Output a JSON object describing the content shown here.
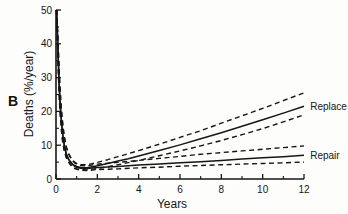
{
  "figure": {
    "panel_label": "B"
  },
  "chart_data": {
    "type": "line",
    "title": "",
    "xlabel": "Years",
    "ylabel": "Deaths (%/year)",
    "xlim": [
      0,
      12
    ],
    "ylim": [
      0,
      50
    ],
    "grid": false,
    "legend_position": "right-annotations",
    "line_color": "#161616",
    "x_ticks": [
      0,
      2,
      4,
      6,
      8,
      10,
      12
    ],
    "x_minor_ticks": [
      1,
      3,
      5,
      7,
      9,
      11
    ],
    "y_ticks": [
      0,
      10,
      20,
      30,
      40,
      50
    ],
    "y_minor_ticks": [
      5,
      15,
      25,
      35,
      45
    ],
    "series": [
      {
        "name": "replace-estimate",
        "group": "Replace",
        "role": "estimate",
        "style": "solid",
        "points": [
          [
            0.03,
            50
          ],
          [
            0.06,
            45
          ],
          [
            0.09,
            39
          ],
          [
            0.12,
            33.5
          ],
          [
            0.15,
            28.5
          ],
          [
            0.2,
            22.5
          ],
          [
            0.25,
            18
          ],
          [
            0.3,
            14.5
          ],
          [
            0.35,
            12
          ],
          [
            0.4,
            10
          ],
          [
            0.45,
            8.6
          ],
          [
            0.5,
            7.5
          ],
          [
            0.6,
            6.0
          ],
          [
            0.7,
            5.1
          ],
          [
            0.8,
            4.4
          ],
          [
            0.9,
            4.0
          ],
          [
            1.0,
            3.7
          ],
          [
            1.2,
            3.4
          ],
          [
            1.5,
            3.3
          ],
          [
            2,
            3.9
          ],
          [
            2.5,
            4.6
          ],
          [
            3,
            5.3
          ],
          [
            3.5,
            6.0
          ],
          [
            4,
            6.8
          ],
          [
            5,
            8.4
          ],
          [
            6,
            10.1
          ],
          [
            7,
            11.9
          ],
          [
            8,
            13.7
          ],
          [
            9,
            15.6
          ],
          [
            10,
            17.5
          ],
          [
            11,
            19.5
          ],
          [
            12,
            21.5
          ]
        ]
      },
      {
        "name": "replace-upper-ci",
        "group": "Replace",
        "role": "upper-confidence-limit",
        "style": "dashed",
        "points": [
          [
            0.04,
            50
          ],
          [
            0.07,
            45
          ],
          [
            0.1,
            40
          ],
          [
            0.14,
            34
          ],
          [
            0.18,
            28.5
          ],
          [
            0.23,
            23
          ],
          [
            0.28,
            19
          ],
          [
            0.34,
            15.5
          ],
          [
            0.4,
            12.5
          ],
          [
            0.5,
            9.5
          ],
          [
            0.6,
            7.7
          ],
          [
            0.7,
            6.5
          ],
          [
            0.8,
            5.6
          ],
          [
            0.9,
            5.0
          ],
          [
            1.0,
            4.6
          ],
          [
            1.2,
            4.3
          ],
          [
            1.5,
            4.2
          ],
          [
            2,
            4.9
          ],
          [
            2.5,
            5.7
          ],
          [
            3,
            6.6
          ],
          [
            4,
            8.4
          ],
          [
            5,
            10.3
          ],
          [
            6,
            12.3
          ],
          [
            7,
            14.3
          ],
          [
            8,
            16.5
          ],
          [
            9,
            18.7
          ],
          [
            10,
            20.9
          ],
          [
            11,
            23.2
          ],
          [
            12,
            25.5
          ]
        ]
      },
      {
        "name": "replace-lower-ci",
        "group": "Replace",
        "role": "lower-confidence-limit",
        "style": "dashed",
        "points": [
          [
            0.02,
            50
          ],
          [
            0.05,
            44
          ],
          [
            0.08,
            38
          ],
          [
            0.11,
            32
          ],
          [
            0.14,
            27
          ],
          [
            0.18,
            21.5
          ],
          [
            0.23,
            16.8
          ],
          [
            0.28,
            13.3
          ],
          [
            0.33,
            10.8
          ],
          [
            0.4,
            8.4
          ],
          [
            0.5,
            6.4
          ],
          [
            0.6,
            5.2
          ],
          [
            0.7,
            4.3
          ],
          [
            0.8,
            3.7
          ],
          [
            0.9,
            3.3
          ],
          [
            1.0,
            3.0
          ],
          [
            1.2,
            2.8
          ],
          [
            1.5,
            2.7
          ],
          [
            2,
            3.1
          ],
          [
            2.5,
            3.6
          ],
          [
            3,
            4.2
          ],
          [
            4,
            5.5
          ],
          [
            5,
            6.9
          ],
          [
            6,
            8.3
          ],
          [
            7,
            9.8
          ],
          [
            8,
            11.4
          ],
          [
            9,
            13.1
          ],
          [
            10,
            14.9
          ],
          [
            11,
            16.9
          ],
          [
            12,
            19.0
          ]
        ]
      },
      {
        "name": "repair-estimate",
        "group": "Repair",
        "role": "estimate",
        "style": "solid",
        "points": [
          [
            0.03,
            50
          ],
          [
            0.06,
            45
          ],
          [
            0.09,
            39
          ],
          [
            0.12,
            33.5
          ],
          [
            0.15,
            28.5
          ],
          [
            0.2,
            22.5
          ],
          [
            0.25,
            18
          ],
          [
            0.3,
            14.5
          ],
          [
            0.35,
            12
          ],
          [
            0.4,
            10
          ],
          [
            0.45,
            8.6
          ],
          [
            0.5,
            7.4
          ],
          [
            0.6,
            5.9
          ],
          [
            0.7,
            5.0
          ],
          [
            0.8,
            4.3
          ],
          [
            0.9,
            3.8
          ],
          [
            1.0,
            3.5
          ],
          [
            1.2,
            3.2
          ],
          [
            1.5,
            3.1
          ],
          [
            2,
            3.4
          ],
          [
            3,
            3.7
          ],
          [
            4,
            4.1
          ],
          [
            5,
            4.4
          ],
          [
            6,
            4.8
          ],
          [
            7,
            5.1
          ],
          [
            8,
            5.5
          ],
          [
            9,
            5.9
          ],
          [
            10,
            6.3
          ],
          [
            11,
            6.6
          ],
          [
            12,
            7.0
          ]
        ]
      },
      {
        "name": "repair-upper-ci",
        "group": "Repair",
        "role": "upper-confidence-limit",
        "style": "dashed",
        "points": [
          [
            0.04,
            50
          ],
          [
            0.07,
            45
          ],
          [
            0.1,
            40
          ],
          [
            0.14,
            34
          ],
          [
            0.18,
            28.5
          ],
          [
            0.23,
            23
          ],
          [
            0.28,
            19
          ],
          [
            0.34,
            15.5
          ],
          [
            0.4,
            12.5
          ],
          [
            0.5,
            9.4
          ],
          [
            0.6,
            7.5
          ],
          [
            0.7,
            6.3
          ],
          [
            0.8,
            5.4
          ],
          [
            0.9,
            4.8
          ],
          [
            1.0,
            4.4
          ],
          [
            1.2,
            4.0
          ],
          [
            1.5,
            3.9
          ],
          [
            2,
            4.4
          ],
          [
            3,
            4.9
          ],
          [
            4,
            5.5
          ],
          [
            5,
            6.1
          ],
          [
            6,
            6.7
          ],
          [
            7,
            7.3
          ],
          [
            8,
            7.8
          ],
          [
            9,
            8.3
          ],
          [
            10,
            8.8
          ],
          [
            11,
            9.3
          ],
          [
            12,
            9.8
          ]
        ]
      },
      {
        "name": "repair-lower-ci",
        "group": "Repair",
        "role": "lower-confidence-limit",
        "style": "dashed",
        "points": [
          [
            0.02,
            50
          ],
          [
            0.05,
            44
          ],
          [
            0.08,
            38
          ],
          [
            0.11,
            32
          ],
          [
            0.14,
            27
          ],
          [
            0.18,
            21.5
          ],
          [
            0.23,
            16.8
          ],
          [
            0.28,
            13.3
          ],
          [
            0.33,
            10.8
          ],
          [
            0.4,
            8.3
          ],
          [
            0.5,
            6.3
          ],
          [
            0.6,
            5.1
          ],
          [
            0.7,
            4.2
          ],
          [
            0.8,
            3.6
          ],
          [
            0.9,
            3.1
          ],
          [
            1.0,
            2.9
          ],
          [
            1.2,
            2.6
          ],
          [
            1.5,
            2.5
          ],
          [
            2,
            2.8
          ],
          [
            3,
            3.0
          ],
          [
            4,
            3.3
          ],
          [
            5,
            3.5
          ],
          [
            6,
            3.8
          ],
          [
            7,
            4.0
          ],
          [
            8,
            4.2
          ],
          [
            9,
            4.4
          ],
          [
            10,
            4.6
          ],
          [
            11,
            4.8
          ],
          [
            12,
            5.0
          ]
        ]
      }
    ],
    "annotations": [
      {
        "text": "Replace",
        "x": 12.3,
        "y": 21.4
      },
      {
        "text": "Repair",
        "x": 12.3,
        "y": 7.1
      }
    ]
  }
}
